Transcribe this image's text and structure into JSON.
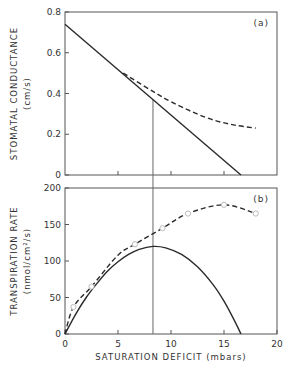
{
  "chart_data": [
    {
      "panel": "a",
      "type": "line",
      "tag": "(a)",
      "ylabel_line1": "STOMATAL CONDUCTANCE",
      "ylabel_line2": "(cm/s)",
      "xlabel": "",
      "xlim": [
        0,
        20
      ],
      "ylim": [
        0,
        0.8
      ],
      "yticks": [
        0,
        0.2,
        0.4,
        0.6,
        0.8
      ],
      "ytick_labels": [
        "0",
        "0.2",
        "0.4",
        "0.6",
        "0.8"
      ],
      "xticks": [
        5,
        10,
        15
      ],
      "series": [
        {
          "name": "linear model",
          "style": "solid",
          "x": [
            0,
            16.6
          ],
          "y": [
            0.74,
            0
          ]
        },
        {
          "name": "observed",
          "style": "dashed",
          "x": [
            5.5,
            8.3,
            10,
            12,
            14,
            16,
            18
          ],
          "y": [
            0.5,
            0.41,
            0.36,
            0.31,
            0.27,
            0.245,
            0.23
          ]
        }
      ],
      "reference_line_x": 8.3
    },
    {
      "panel": "b",
      "type": "line",
      "tag": "(b)",
      "ylabel_line1": "TRANSPIRATION RATE",
      "ylabel_line2": "(nmol/cm²/s)",
      "xlabel": "SATURATION DEFICIT (mbars)",
      "xlim": [
        0,
        20
      ],
      "ylim": [
        0,
        200
      ],
      "xticks": [
        0,
        5,
        10,
        15,
        20
      ],
      "xtick_labels": [
        "0",
        "5",
        "10",
        "15",
        "20"
      ],
      "yticks": [
        0,
        50,
        100,
        150,
        200
      ],
      "ytick_labels": [
        "0",
        "50",
        "100",
        "150",
        "200"
      ],
      "series": [
        {
          "name": "model (parabola)",
          "style": "solid",
          "x": [
            0,
            1,
            2,
            3,
            4,
            5,
            6,
            7,
            8.3,
            9.5,
            11,
            12.5,
            14,
            15,
            16,
            16.6
          ],
          "y": [
            0,
            27,
            50,
            69,
            86,
            99,
            109,
            116,
            120,
            118,
            109,
            92,
            67,
            45,
            18,
            0
          ]
        },
        {
          "name": "observed",
          "style": "dashed",
          "markers": "open-circle",
          "x": [
            0,
            0.8,
            2.5,
            5,
            6.6,
            9.2,
            11.6,
            15,
            18
          ],
          "y": [
            0,
            37,
            65,
            108,
            123,
            145,
            165,
            177,
            165
          ]
        }
      ],
      "markers": {
        "x": [
          0.8,
          2.5,
          6.6,
          9.2,
          11.6,
          15,
          18
        ],
        "y": [
          37,
          65,
          123,
          145,
          165,
          177,
          165
        ]
      },
      "reference_line_x": 8.3
    }
  ],
  "colors": {
    "line": "#2a2a2a",
    "marker": "#bbbbbb",
    "frame": "#555555"
  }
}
